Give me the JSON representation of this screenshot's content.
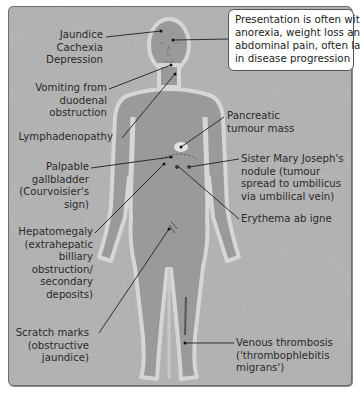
{
  "diagram": {
    "callout": "Presentation is often with\nanorexia, weight loss and\nabdominal pain, often late\nin disease progression",
    "left_labels": [
      {
        "id": "jaundice",
        "text": "Jaundice\nCachexia\nDepression"
      },
      {
        "id": "vomiting",
        "text": "Vomiting from\nduodenal\nobstruction"
      },
      {
        "id": "lymph",
        "text": "Lymphadenopathy"
      },
      {
        "id": "gallbladder",
        "text": "Palpable\ngallbladder\n(Courvoisier's\nsign)"
      },
      {
        "id": "hepatomegaly",
        "text": "Hepatomegaly\n(extrahepatic\nbilliary\nobstruction/\nsecondary\ndeposits)"
      },
      {
        "id": "scratch",
        "text": "Scratch marks\n(obstructive\njaundice)"
      }
    ],
    "right_labels": [
      {
        "id": "pancreatic",
        "text": "Pancreatic\ntumour mass"
      },
      {
        "id": "sister-mary",
        "text": "Sister Mary Joseph's\nnodule (tumour\nspread to umbilicus\nvia umbilical vein)"
      },
      {
        "id": "erythema",
        "text": "Erythema ab igne"
      },
      {
        "id": "venous",
        "text": "Venous thrombosis\n('thrombophlebitis\nmigrans')"
      }
    ],
    "colors": {
      "panel_bg": "#b2b2b2",
      "body_fill": "#999999",
      "body_outline": "#d4d4d4",
      "leader_line": "#1e1e1e",
      "callout_bg": "#ffffff"
    }
  }
}
